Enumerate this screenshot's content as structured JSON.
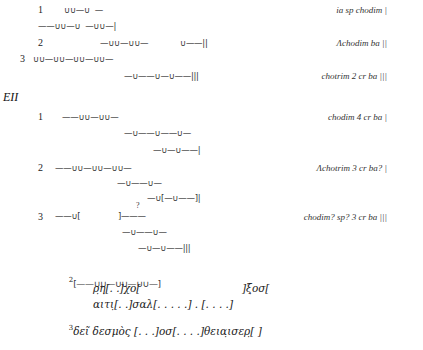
{
  "section_one": {
    "lines": [
      {
        "num": "1",
        "meter": "∪∪—∪  —",
        "annotation": "ia sp chodim |"
      },
      {
        "meter": "——∪∪—∪  —∪∪—|"
      },
      {
        "num": "2",
        "meter": "—∪∪—∪∪—",
        "meter_b": "∪——||",
        "annotation": "Λchodim ba ||"
      },
      {
        "num": "3",
        "meter": "∪∪—∪∪—∪∪—∪∪—"
      },
      {
        "meter": "—∪——∪—∪——|||",
        "annotation": "chotrim 2 cr ba |||"
      }
    ]
  },
  "section_two": {
    "heading": "EII",
    "lines": [
      {
        "num": "1",
        "meter": "——∪∪—∪∪—",
        "annotation": "chodim 4 cr ba |"
      },
      {
        "meter": "—∪——∪——∪—"
      },
      {
        "meter": "—∪—∪——|"
      },
      {
        "num": "2",
        "meter": "——∪∪—∪∪—∪∪—",
        "annotation": "Λchotrim 3 cr ba? |"
      },
      {
        "meter": "—∪——∪—"
      },
      {
        "meter": "—∪[—∪——]|"
      },
      {
        "num": "3",
        "meter": "——∪[",
        "meter_b": "]———",
        "query": "?",
        "annotation": "chodim? sp? 3 cr ba |||"
      },
      {
        "meter": "—∪——∪—"
      },
      {
        "meter": "—∪—∪——|||"
      }
    ]
  },
  "greek_text": {
    "line2_num": "2",
    "line2_meter": "[——∪∪—∪∪—∪∪—]",
    "line2a_left": "ρ̣η̣[. .]χο[",
    "line2a_right": "]ξ̣οσ[",
    "line2b": "αιτι̣[. .]σαλ[. . . . .] . [. . . .]",
    "line3_num": "3",
    "line3": "δεῖ δεσμὸς [. . .]οσ[. . . .]θεια̣ισερ̣[ ]"
  }
}
